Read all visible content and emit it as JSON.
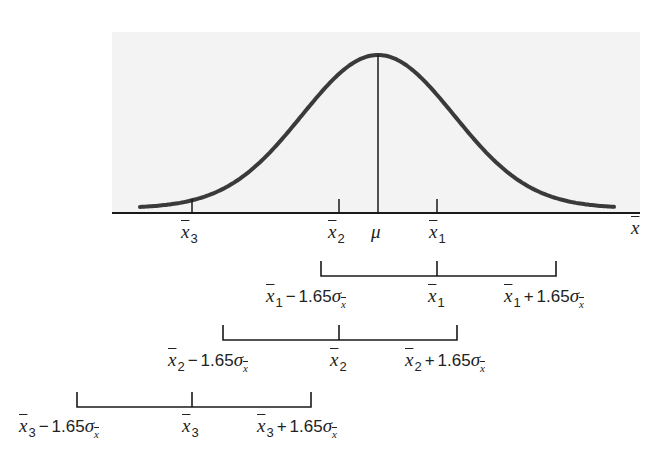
{
  "diagram": {
    "title": "",
    "axis": {
      "variable": "x",
      "variable_decoration": "overbar",
      "label": "x̄",
      "ticks": [
        {
          "id": "x3",
          "label_base": "x",
          "label_sub": "3",
          "px": 192
        },
        {
          "id": "x2",
          "label_base": "x",
          "label_sub": "2",
          "px": 339
        },
        {
          "id": "mu",
          "label": "μ",
          "px": 378
        },
        {
          "id": "x1",
          "label_base": "x",
          "label_sub": "1",
          "px": 437
        }
      ]
    },
    "curve": {
      "type": "normal",
      "center_label": "μ"
    },
    "intervals": [
      {
        "id": "interval-1",
        "lower": {
          "base": "x",
          "sub": "1",
          "op": "−",
          "coef": "1.65",
          "sigma": "σ",
          "sigma_sub": "x"
        },
        "center": {
          "base": "x",
          "sub": "1"
        },
        "upper": {
          "base": "x",
          "sub": "1",
          "op": "+",
          "coef": "1.65",
          "sigma": "σ",
          "sigma_sub": "x"
        }
      },
      {
        "id": "interval-2",
        "lower": {
          "base": "x",
          "sub": "2",
          "op": "−",
          "coef": "1.65",
          "sigma": "σ",
          "sigma_sub": "x"
        },
        "center": {
          "base": "x",
          "sub": "2"
        },
        "upper": {
          "base": "x",
          "sub": "2",
          "op": "+",
          "coef": "1.65",
          "sigma": "σ",
          "sigma_sub": "x"
        }
      },
      {
        "id": "interval-3",
        "lower": {
          "base": "x",
          "sub": "3",
          "op": "−",
          "coef": "1.65",
          "sigma": "σ",
          "sigma_sub": "x"
        },
        "center": {
          "base": "x",
          "sub": "3"
        },
        "upper": {
          "base": "x",
          "sub": "3",
          "op": "+",
          "coef": "1.65",
          "sigma": "σ",
          "sigma_sub": "x"
        }
      }
    ],
    "colors": {
      "curve": "#3a3a3a",
      "axis": "#1a1a1a",
      "background_panel": "#f3f3f3"
    }
  }
}
